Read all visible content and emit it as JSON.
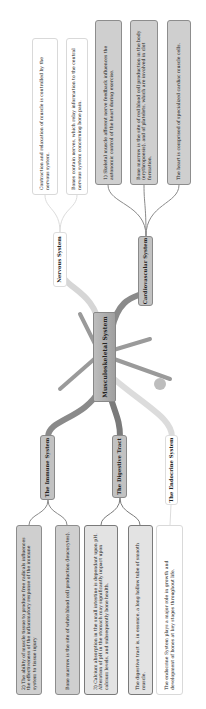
{
  "central": {
    "label": "Musculoskeletal System"
  },
  "branches": {
    "nervous": {
      "label": "Nervous System",
      "leaves": [
        "Contraction and relaxation of muscle is controlled by the nervous system.",
        "Bones contain nerves, which relay information to the central nervous system concerning bone pain."
      ]
    },
    "cardiovascular": {
      "label": "Cardiovascular System",
      "leaves": [
        "1) Skeletal muscle afferent nerve feedback influences the autonomic control of the heart during exercise.",
        "Bone marrow is the site of red blood cell production in the body (erythropoesis), and of platelets, which are involved in clot formation.",
        "The heart is comprised of specialized cardiac muscle cells."
      ]
    },
    "immune": {
      "label": "The Immune System",
      "leaves": [
        "2) The ability of muscle tissue to produce free radicals influences the effectiveness of the inflammatory response of the immune system to tissue injury",
        "Bone marrow is the site of white blood cell production (leucocytes)."
      ]
    },
    "digestive": {
      "label": "The Digestive Tract",
      "leaves": [
        "3) Calcium absorption in the small intestine is dependant upon pH. Alteration of pH in the stomach may significantly impact upon calcium levels, and subsequently bone health.",
        "The digestive tract is, in essence, a long hollow tube of smooth muscle."
      ]
    },
    "endocrine": {
      "label": "The Endocrine System",
      "leaves": [
        "The endocrine System plays a major role in growth and development of bones at key stages throughout life."
      ]
    }
  },
  "colors": {
    "dark_link": "#7d7d7d",
    "light_link": "#cfcfcf",
    "gray_fill": "#cfcfcf",
    "white_fill": "#ffffff"
  }
}
